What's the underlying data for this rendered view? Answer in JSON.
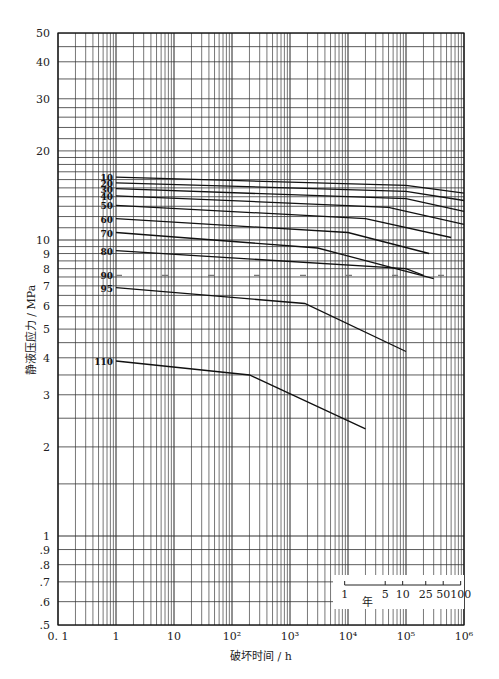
{
  "chart_data": {
    "type": "line",
    "title": "",
    "xlabel": "破坏时间 / h",
    "ylabel": "静液压应力 / MPa",
    "xscale": "log",
    "yscale": "log",
    "xlim": [
      0.1,
      1000000
    ],
    "ylim": [
      0.5,
      50
    ],
    "grid": true,
    "x_tick_labels": [
      "0.1",
      "1",
      "10",
      "10^2",
      "10^3",
      "10^4",
      "10^5",
      "10^6"
    ],
    "y_tick_labels": [
      "50",
      "40",
      "30",
      "20",
      "10",
      "9",
      "8",
      "7",
      "6",
      "5",
      "4",
      "3",
      "2",
      "1",
      ".9",
      ".8",
      ".7",
      ".6",
      ".5"
    ],
    "secondary_axis": {
      "label": "年",
      "ticks": [
        "1",
        "5",
        "10",
        "25",
        "50",
        "100"
      ],
      "hours": [
        8760,
        43800,
        87600,
        219000,
        438000,
        876000
      ]
    },
    "series": [
      {
        "name": "10°C",
        "x": [
          1,
          100000,
          1000000
        ],
        "y": [
          16.3,
          15.3,
          14.4
        ]
      },
      {
        "name": "20°C",
        "x": [
          1,
          100000,
          1000000
        ],
        "y": [
          15.6,
          14.6,
          13.6
        ]
      },
      {
        "name": "30°C",
        "x": [
          1,
          100000,
          1000000
        ],
        "y": [
          14.9,
          13.8,
          12.5
        ]
      },
      {
        "name": "40°C",
        "x": [
          1,
          50000,
          1000000
        ],
        "y": [
          14.1,
          12.9,
          11.3
        ]
      },
      {
        "name": "50°C",
        "x": [
          1,
          20000,
          600000
        ],
        "y": [
          13.1,
          11.8,
          10.2
        ]
      },
      {
        "name": "60°C",
        "x": [
          1,
          10000,
          250000
        ],
        "y": [
          11.8,
          10.6,
          9.0
        ]
      },
      {
        "name": "70°C",
        "x": [
          1,
          3000,
          300000
        ],
        "y": [
          10.6,
          9.4,
          7.4
        ]
      },
      {
        "name": "80°C",
        "x": [
          1,
          100000,
          200000
        ],
        "y": [
          9.2,
          8.0,
          7.6
        ]
      },
      {
        "name": "90°C",
        "x": [
          1,
          10000,
          600000
        ],
        "y": [
          7.6,
          7.6,
          7.6
        ],
        "dashed": true
      },
      {
        "name": "95°C",
        "x": [
          1,
          1800,
          100000
        ],
        "y": [
          6.9,
          6.1,
          4.2
        ]
      },
      {
        "name": "110°C",
        "x": [
          1,
          200,
          20000
        ],
        "y": [
          3.9,
          3.5,
          2.3
        ]
      }
    ]
  }
}
